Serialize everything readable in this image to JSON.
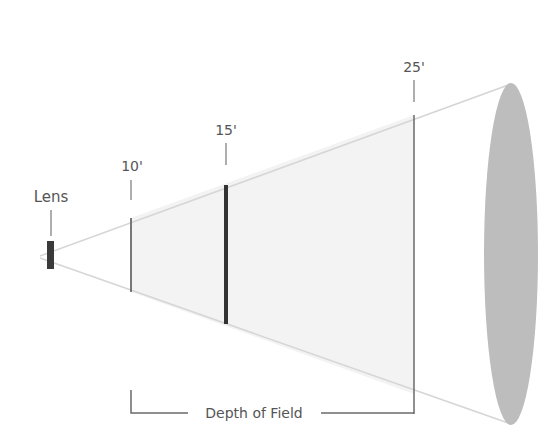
{
  "diagram": {
    "title": "Depth of Field",
    "lens_label": "Lens",
    "markers": [
      {
        "label": "10'",
        "role": "near-limit"
      },
      {
        "label": "15'",
        "role": "focus-distance"
      },
      {
        "label": "25'",
        "role": "far-limit"
      }
    ],
    "bracket_label": "Depth of Field",
    "colors": {
      "line": "#6a6a6a",
      "focus_line": "#333333",
      "cone_edge": "#d8d8d8",
      "dof_fill": "#f3f3f3",
      "ellipse_fill": "#bdbdbd",
      "text": "#555555",
      "lens": "#3a3a3a"
    }
  }
}
